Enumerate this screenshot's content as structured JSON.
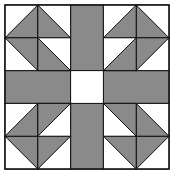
{
  "diagram": {
    "title": "",
    "type": "quilt-block",
    "grid": 5,
    "colors": {
      "fill": "#8a8a8a",
      "background": "#ffffff",
      "stroke": "#111111"
    },
    "quadrant_pattern": "half-square triangles pinwheel corners with gray cross bands and white center square"
  }
}
